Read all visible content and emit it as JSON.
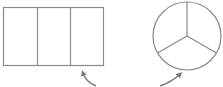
{
  "diagram": {
    "type": "fraction-shapes",
    "stroke_color": "#8a8a8a",
    "background": "#ffffff",
    "shapes": [
      {
        "id": "rectangle",
        "kind": "rectangle",
        "parts": 3,
        "x": 3,
        "y": 7,
        "width": 101,
        "height": 59,
        "dividers_x": [
          36.7,
          70.3
        ]
      },
      {
        "id": "circle",
        "kind": "circle",
        "parts": 3,
        "cx": 187,
        "cy": 36,
        "r": 34,
        "sector_angles_deg": [
          -90,
          30,
          150
        ]
      }
    ],
    "arrows": [
      {
        "id": "arrow-to-rectangle",
        "points_to": "rectangle",
        "from": [
          96,
          86
        ],
        "to": [
          82,
          71
        ]
      },
      {
        "id": "arrow-to-circle",
        "points_to": "circle",
        "from": [
          160,
          86
        ],
        "to": [
          181,
          73
        ]
      }
    ]
  }
}
